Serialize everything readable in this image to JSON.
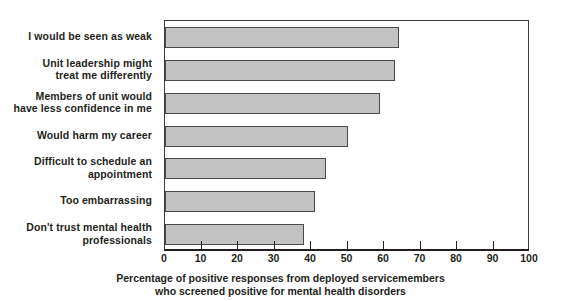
{
  "chart_data": {
    "type": "bar",
    "orientation": "horizontal",
    "title": "",
    "subtitle": "",
    "xlabel_line1": "Percentage of positive responses from deployed servicemembers",
    "xlabel_line2": "who screened positive for mental health disorders",
    "ylabel": "",
    "xlim": [
      0,
      100
    ],
    "xticks": [
      0,
      10,
      20,
      30,
      40,
      50,
      60,
      70,
      80,
      90,
      100
    ],
    "xtick_labels": [
      "0",
      "10",
      "20",
      "30",
      "40",
      "50",
      "60",
      "70",
      "80",
      "90",
      "100"
    ],
    "grid": false,
    "legend": false,
    "legend_position": "none",
    "bar_fill_color": "#c2c2c2",
    "bar_edge_color": "#4a4a4a",
    "axis_color": "#231f20",
    "text_color": "#231f20",
    "categories": [
      "I would be seen as weak",
      "Unit leadership might\ntreat me differently",
      "Members of unit would\nhave less confidence in me",
      "Would harm my career",
      "Difficult to schedule an\nappointment",
      "Too embarrassing",
      "Don't trust mental health\nprofessionals"
    ],
    "values": [
      64,
      63,
      59,
      50,
      44,
      41,
      38
    ],
    "series": [
      {
        "name": "Percentage of positive responses",
        "values": [
          64,
          63,
          59,
          50,
          44,
          41,
          38
        ]
      }
    ]
  }
}
